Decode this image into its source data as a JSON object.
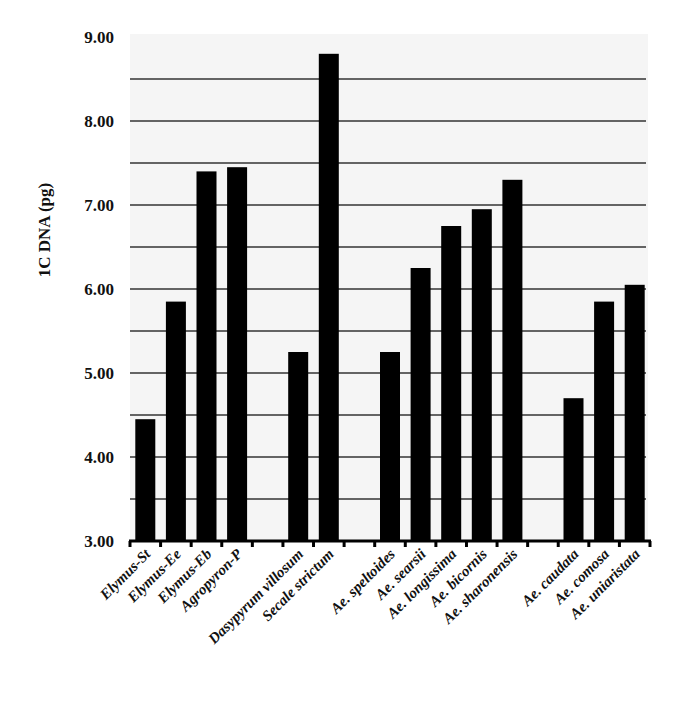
{
  "chart_data": {
    "type": "bar",
    "title": "",
    "xlabel": "",
    "ylabel": "1C DNA (pg)",
    "ylim": [
      3.0,
      9.0
    ],
    "yticks": [
      "3.00",
      "4.00",
      "5.00",
      "6.00",
      "7.00",
      "8.00",
      "9.00"
    ],
    "grid": {
      "horizontal": true,
      "interval": 0.5
    },
    "legend": null,
    "bar_color": "#000000",
    "plot_background": "#f5f5f5",
    "groups": [
      {
        "categories": [
          "Elymus-St",
          "Elymus-Ee",
          "Elymus-Eb",
          "Agropyron-P"
        ],
        "values": [
          4.45,
          5.85,
          7.4,
          7.45
        ]
      },
      {
        "categories": [
          "Dasypyrum villosum",
          "Secale strictum"
        ],
        "values": [
          5.25,
          8.8
        ]
      },
      {
        "categories": [
          "Ae. speltoides",
          "Ae. searsii",
          "Ae. longissima",
          "Ae. bicornis",
          "Ae. sharonensis"
        ],
        "values": [
          5.25,
          6.25,
          6.75,
          6.95,
          7.3
        ]
      },
      {
        "categories": [
          "Ae. caudata",
          "Ae. comosa",
          "Ae. uniaristata"
        ],
        "values": [
          4.7,
          5.85,
          6.05
        ]
      }
    ],
    "categories": [
      "Elymus-St",
      "Elymus-Ee",
      "Elymus-Eb",
      "Agropyron-P",
      "",
      "Dasypyrum villosum",
      "Secale strictum",
      "",
      "Ae. speltoides",
      "Ae. searsii",
      "Ae. longissima",
      "Ae. bicornis",
      "Ae. sharonensis",
      "",
      "Ae. caudata",
      "Ae. comosa",
      "Ae. uniaristata"
    ],
    "values": [
      4.45,
      5.85,
      7.4,
      7.45,
      null,
      5.25,
      8.8,
      null,
      5.25,
      6.25,
      6.75,
      6.95,
      7.3,
      null,
      4.7,
      5.85,
      6.05
    ]
  }
}
